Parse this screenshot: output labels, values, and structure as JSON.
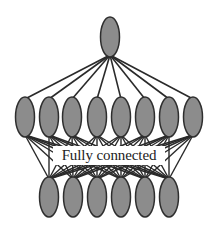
{
  "diagram": {
    "type": "neural-network-connectivity",
    "label": "Fully connected",
    "colors": {
      "node_fill": "#8c8c8c",
      "node_stroke": "#2e2e2e",
      "edge": "#2a2a2a",
      "background": "#ffffff"
    },
    "layers": [
      {
        "name": "top",
        "nodes": [
          {
            "cx": 110,
            "cy": 37
          }
        ]
      },
      {
        "name": "middle",
        "nodes": [
          {
            "cx": 25,
            "cy": 117
          },
          {
            "cx": 49,
            "cy": 117
          },
          {
            "cx": 72,
            "cy": 117
          },
          {
            "cx": 97,
            "cy": 117
          },
          {
            "cx": 121,
            "cy": 117
          },
          {
            "cx": 145,
            "cy": 117
          },
          {
            "cx": 169,
            "cy": 117
          },
          {
            "cx": 193,
            "cy": 117
          }
        ]
      },
      {
        "name": "bottom",
        "nodes": [
          {
            "cx": 49,
            "cy": 197
          },
          {
            "cx": 73,
            "cy": 197
          },
          {
            "cx": 97,
            "cy": 197
          },
          {
            "cx": 121,
            "cy": 197
          },
          {
            "cx": 145,
            "cy": 197
          },
          {
            "cx": 169,
            "cy": 197
          }
        ]
      }
    ],
    "node_rx": 9.5,
    "node_ry": 20
  }
}
